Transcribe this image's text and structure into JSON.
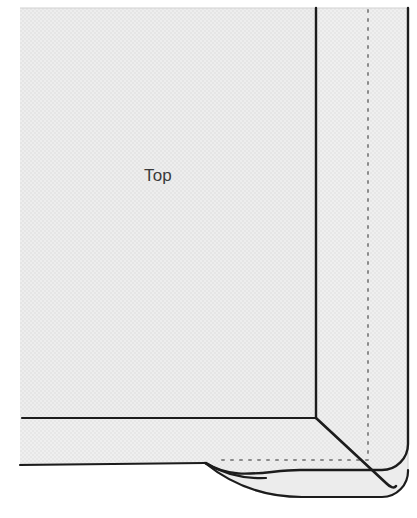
{
  "figure": {
    "width": 417,
    "height": 518,
    "background_color": "#ffffff"
  },
  "labels": [
    {
      "id": "top-label",
      "text": "Top",
      "x": 158,
      "y": 181,
      "color": "#3a3a3a",
      "font_size": 17
    }
  ],
  "colors": {
    "page_background": "#ffffff",
    "fabric_fill": "#e9e9e9",
    "fabric_fill_band": "#ebebeb",
    "fabric_fill_flap": "#ececec",
    "outline_stroke": "#1c1c1c",
    "soft_edge_stroke": "#cfcfcf",
    "dotted_stitch_stroke": "#8a8a8a",
    "label_color": "#3a3a3a"
  },
  "regions": [
    {
      "id": "top-panel",
      "name": "top-panel",
      "description": "Large upper-left fabric panel labelled Top",
      "fill": "#e9e9e9"
    },
    {
      "id": "right-hem-band",
      "name": "right-hem-band",
      "description": "Vertical hem band along the right edge",
      "fill": "#ebebeb"
    },
    {
      "id": "bottom-hem-band",
      "name": "bottom-hem-band",
      "description": "Horizontal hem band across the bottom",
      "fill": "#ebebeb"
    },
    {
      "id": "corner-flap",
      "name": "corner-flap",
      "description": "Folded corner flap extending past the bottom hem",
      "fill": "#ececec"
    }
  ],
  "lines": [
    {
      "id": "vertical-fold-line",
      "name": "vertical-fold-line",
      "style": "solid",
      "stroke": "#1c1c1c",
      "width": 2.4,
      "from": [
        316,
        8
      ],
      "to": [
        316,
        418
      ]
    },
    {
      "id": "right-edge-line",
      "name": "right-edge-line",
      "style": "solid",
      "stroke": "#1c1c1c",
      "width": 2.4,
      "from": [
        408,
        8
      ],
      "to": [
        408,
        470
      ]
    },
    {
      "id": "bottom-fold-line",
      "name": "bottom-fold-line",
      "style": "solid",
      "stroke": "#1c1c1c",
      "width": 2.2,
      "from": [
        22,
        418
      ],
      "to": [
        316,
        418
      ]
    },
    {
      "id": "bottom-edge-line",
      "name": "bottom-edge-line",
      "style": "solid",
      "stroke": "#1c1c1c",
      "width": 2.2,
      "from": [
        20,
        465
      ],
      "to": [
        205,
        463
      ]
    },
    {
      "id": "miter-diagonal-line",
      "name": "miter-diagonal-line",
      "style": "solid",
      "stroke": "#1c1c1c",
      "width": 2.6,
      "from": [
        316,
        418
      ],
      "to": [
        389,
        487
      ]
    }
  ],
  "dotted_lines": [
    {
      "id": "vertical-stitch-line",
      "name": "vertical-stitch-line",
      "style": "dotted",
      "stroke": "#8a8a8a",
      "width": 2,
      "dash": "2 7",
      "from": [
        368,
        10
      ],
      "to": [
        368,
        460
      ]
    },
    {
      "id": "horizontal-stitch-line",
      "name": "horizontal-stitch-line",
      "style": "dotted",
      "stroke": "#8a8a8a",
      "width": 2,
      "dash": "2 7",
      "from": [
        222,
        460
      ],
      "to": [
        374,
        460
      ]
    }
  ],
  "geometry": {
    "fabric_left": 20,
    "fabric_top": 8,
    "fabric_right": 408,
    "vertical_fold_x": 316,
    "vertical_stitch_x": 368,
    "bottom_fold_y": 418,
    "bottom_edge_y": 464,
    "stitch_row_y": 460,
    "corner_radius": 26
  }
}
